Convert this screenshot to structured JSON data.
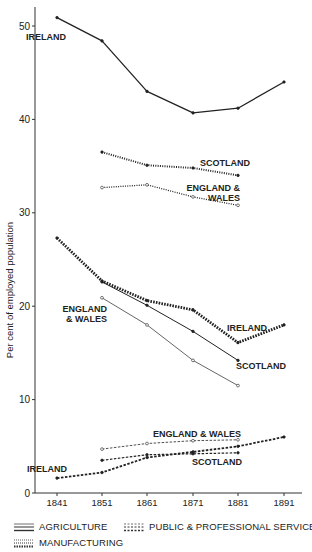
{
  "chart_data": {
    "type": "line",
    "title": "",
    "xlabel": "",
    "ylabel": "Per cent of employed population",
    "ylim": [
      0,
      52
    ],
    "yticks": [
      0,
      10,
      20,
      30,
      40,
      50
    ],
    "x": [
      1841,
      1851,
      1861,
      1871,
      1881,
      1891
    ],
    "grid": false,
    "legend_position": "bottom",
    "legend": [
      {
        "label": "AGRICULTURE",
        "style": "solid"
      },
      {
        "label": "PUBLIC & PROFESSIONAL SERVICES",
        "style": "dashed"
      },
      {
        "label": "MANUFACTURING",
        "style": "dotted"
      }
    ],
    "line_weight_note": "thin = England & Wales, medium = Scotland, thick = Ireland",
    "series": [
      {
        "name": "Agriculture - Ireland",
        "sector": "agriculture",
        "region": "Ireland",
        "style": "solid",
        "weight": 1.3,
        "x": [
          1841,
          1851,
          1861,
          1871,
          1881,
          1891
        ],
        "values": [
          50.9,
          48.4,
          43.0,
          40.7,
          41.2,
          44.0
        ]
      },
      {
        "name": "Agriculture - Scotland",
        "sector": "agriculture",
        "region": "Scotland",
        "style": "solid",
        "weight": 1.0,
        "x": [
          1851,
          1861,
          1871,
          1881
        ],
        "values": [
          22.6,
          20.1,
          17.3,
          14.2
        ]
      },
      {
        "name": "Agriculture - England & Wales",
        "sector": "agriculture",
        "region": "England & Wales",
        "style": "solid",
        "weight": 0.7,
        "x": [
          1851,
          1861,
          1871,
          1881
        ],
        "values": [
          20.9,
          18.0,
          14.2,
          11.5
        ]
      },
      {
        "name": "Manufacturing - Scotland",
        "sector": "manufacturing",
        "region": "Scotland",
        "style": "dotted",
        "weight": 2.0,
        "x": [
          1851,
          1861,
          1871,
          1881
        ],
        "values": [
          36.5,
          35.1,
          34.8,
          34.0
        ]
      },
      {
        "name": "Manufacturing - England & Wales",
        "sector": "manufacturing",
        "region": "England & Wales",
        "style": "dotted",
        "weight": 1.3,
        "x": [
          1851,
          1861,
          1871,
          1881
        ],
        "values": [
          32.7,
          33.0,
          31.7,
          30.8
        ]
      },
      {
        "name": "Manufacturing - Ireland",
        "sector": "manufacturing",
        "region": "Ireland",
        "style": "dotted",
        "weight": 2.8,
        "x": [
          1841,
          1851,
          1861,
          1871,
          1881,
          1891
        ],
        "values": [
          27.3,
          22.7,
          20.6,
          19.6,
          16.1,
          18.0
        ]
      },
      {
        "name": "Public & Professional Services - England & Wales",
        "sector": "services",
        "region": "England & Wales",
        "style": "dashed",
        "weight": 0.8,
        "x": [
          1851,
          1861,
          1871,
          1881
        ],
        "values": [
          4.7,
          5.3,
          5.6,
          5.7
        ]
      },
      {
        "name": "Public & Professional Services - Scotland",
        "sector": "services",
        "region": "Scotland",
        "style": "dashed",
        "weight": 1.2,
        "x": [
          1851,
          1861,
          1871,
          1881
        ],
        "values": [
          3.5,
          4.1,
          4.2,
          4.3
        ]
      },
      {
        "name": "Public & Professional Services - Ireland",
        "sector": "services",
        "region": "Ireland",
        "style": "dashed",
        "weight": 1.8,
        "x": [
          1841,
          1851,
          1861,
          1871,
          1881,
          1891
        ],
        "values": [
          1.6,
          2.2,
          3.8,
          4.4,
          5.0,
          6.0
        ]
      }
    ],
    "annotations": [
      {
        "text": "IRELAND",
        "x": 26,
        "y": 40,
        "anchor": "start"
      },
      {
        "text": "SCOTLAND",
        "x": 250,
        "y": 166,
        "anchor": "end"
      },
      {
        "text": "ENGLAND &",
        "x": 240,
        "y": 191,
        "anchor": "end"
      },
      {
        "text": "WALES",
        "x": 240,
        "y": 201,
        "anchor": "end"
      },
      {
        "text": "ENGLAND",
        "x": 107,
        "y": 312,
        "anchor": "end"
      },
      {
        "text": "& WALES",
        "x": 107,
        "y": 322,
        "anchor": "end"
      },
      {
        "text": "IRELAND",
        "x": 227,
        "y": 331,
        "anchor": "start"
      },
      {
        "text": "SCOTLAND",
        "x": 236,
        "y": 369,
        "anchor": "start"
      },
      {
        "text": "ENGLAND & WALES",
        "x": 241,
        "y": 437,
        "anchor": "end"
      },
      {
        "text": "SCOTLAND",
        "x": 242,
        "y": 465,
        "anchor": "end"
      },
      {
        "text": "IRELAND",
        "x": 27,
        "y": 472,
        "anchor": "start"
      }
    ]
  },
  "legend": {
    "agriculture": "AGRICULTURE",
    "services": "PUBLIC & PROFESSIONAL SERVICES",
    "manufacturing": "MANUFACTURING"
  },
  "axis": {
    "ylabel": "Per cent of employed population"
  }
}
